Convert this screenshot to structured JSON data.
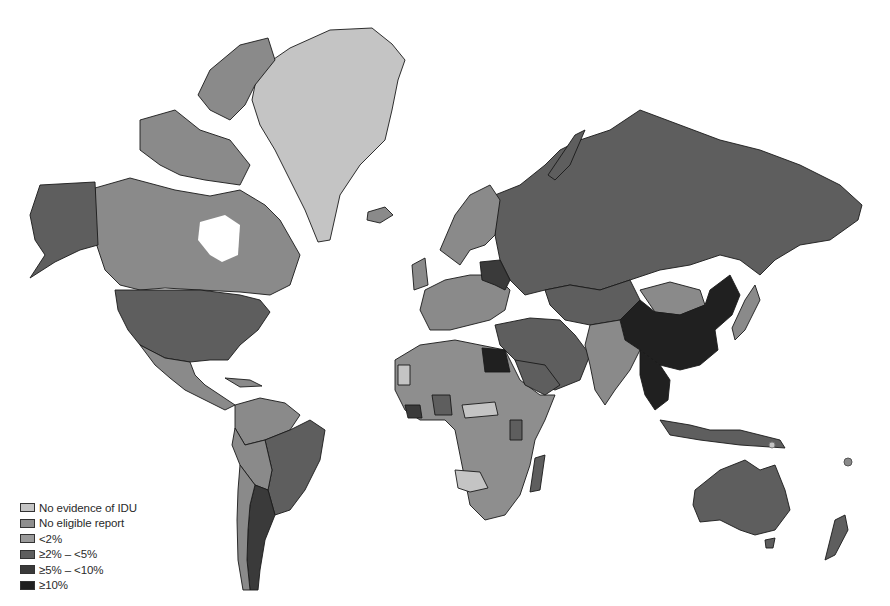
{
  "map": {
    "title": "World map of injecting drug use (IDU) HIV prevalence categories",
    "categories": [
      {
        "key": "no_evidence",
        "label": "No evidence of IDU",
        "color": "#c4c4c4"
      },
      {
        "key": "no_report",
        "label": "No eligible report",
        "color": "#8e8e8e"
      },
      {
        "key": "lt2",
        "label": "<2%",
        "color": "#8a8a8a"
      },
      {
        "key": "2to5",
        "label": "≥2% – <5%",
        "color": "#5e5e5e"
      },
      {
        "key": "5to10",
        "label": "≥5% – <10%",
        "color": "#3a3a3a"
      },
      {
        "key": "ge10",
        "label": "≥10%",
        "color": "#202020"
      }
    ],
    "regions": [
      {
        "name": "Greenland",
        "category": "no_evidence"
      },
      {
        "name": "Canada",
        "category": "lt2"
      },
      {
        "name": "Alaska/USA",
        "category": "2to5"
      },
      {
        "name": "Mexico",
        "category": "lt2"
      },
      {
        "name": "Brazil",
        "category": "2to5"
      },
      {
        "name": "Argentina",
        "category": "5to10"
      },
      {
        "name": "Russia",
        "category": "2to5"
      },
      {
        "name": "China",
        "category": "ge10"
      },
      {
        "name": "Mongolia",
        "category": "lt2"
      },
      {
        "name": "India",
        "category": "lt2"
      },
      {
        "name": "Australia",
        "category": "2to5"
      },
      {
        "name": "Egypt",
        "category": "ge10"
      },
      {
        "name": "Saudi Arabia",
        "category": "2to5"
      },
      {
        "name": "Western Europe",
        "category": "lt2"
      },
      {
        "name": "Scandinavia",
        "category": "lt2"
      },
      {
        "name": "Southeast Asia",
        "category": "ge10"
      },
      {
        "name": "Africa",
        "category": "no_report"
      },
      {
        "name": "Namibia/Botswana",
        "category": "no_evidence"
      },
      {
        "name": "Madagascar",
        "category": "2to5"
      },
      {
        "name": "New Zealand",
        "category": "2to5"
      }
    ]
  }
}
